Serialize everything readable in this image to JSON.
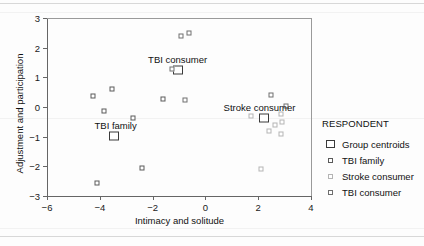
{
  "chart_data": {
    "type": "scatter",
    "title": "",
    "xlabel": "Intimacy and solitude",
    "ylabel": "Adjustment and participation",
    "xlim": [
      -6,
      4
    ],
    "ylim": [
      -3,
      3
    ],
    "xticks": [
      -6,
      -4,
      -2,
      0,
      2,
      4
    ],
    "yticks": [
      -3,
      -2,
      -1,
      0,
      1,
      2,
      3
    ],
    "xtick_labels": [
      "−6",
      "−4",
      "−2",
      "0",
      "2",
      "4"
    ],
    "ytick_labels": [
      "−3",
      "−2",
      "−1",
      "0",
      "1",
      "2",
      "3"
    ],
    "grid": false,
    "legend_position": "right",
    "legend_title": "RESPONDENT",
    "series": [
      {
        "name": "Group centroids",
        "marker": "open-square-large",
        "color": "#3a3a3a",
        "points": [
          {
            "x": -3.45,
            "y": -0.98
          },
          {
            "x": -1.02,
            "y": 1.25
          },
          {
            "x": 2.22,
            "y": -0.38
          }
        ]
      },
      {
        "name": "TBI family",
        "marker": "open-square-small",
        "color": "#5a5a5a",
        "points": [
          {
            "x": -4.25,
            "y": 0.38
          },
          {
            "x": -3.55,
            "y": 0.6
          },
          {
            "x": -3.85,
            "y": -0.13
          },
          {
            "x": -2.75,
            "y": -0.37
          },
          {
            "x": -2.42,
            "y": -2.05
          },
          {
            "x": -4.12,
            "y": -2.55
          },
          {
            "x": -1.62,
            "y": 0.28
          }
        ]
      },
      {
        "name": "Stroke consumer",
        "marker": "open-square-small",
        "color": "#b4b4b4",
        "points": [
          {
            "x": 1.72,
            "y": -0.3
          },
          {
            "x": 2.62,
            "y": -0.62
          },
          {
            "x": 2.4,
            "y": -0.82
          },
          {
            "x": 2.1,
            "y": -2.1
          },
          {
            "x": 2.88,
            "y": -0.22
          },
          {
            "x": 2.92,
            "y": -0.5
          },
          {
            "x": 2.85,
            "y": -0.92
          }
        ]
      },
      {
        "name": "TBI consumer",
        "marker": "open-square-small",
        "color": "#6f6f6f",
        "points": [
          {
            "x": -0.92,
            "y": 2.4
          },
          {
            "x": -0.62,
            "y": 2.5
          },
          {
            "x": -1.28,
            "y": 1.28
          },
          {
            "x": -0.78,
            "y": 0.22
          },
          {
            "x": 2.5,
            "y": 0.42
          },
          {
            "x": 3.05,
            "y": 0.02
          }
        ]
      }
    ],
    "annotations": [
      {
        "text": "TBI consumer",
        "x": -1.05,
        "y": 1.62
      },
      {
        "text": "TBI family",
        "x": -3.4,
        "y": -0.62
      },
      {
        "text": "Stroke consumer",
        "x": 2.05,
        "y": 0.0
      }
    ]
  },
  "legend": {
    "title": "RESPONDENT",
    "entries": [
      {
        "label": "Group centroids",
        "key": "group-centroids-key"
      },
      {
        "label": "TBI family",
        "key": "tbi-family-key"
      },
      {
        "label": "Stroke consumer",
        "key": "stroke-consumer-key"
      },
      {
        "label": "TBI consumer",
        "key": "tbi-consumer-key"
      }
    ]
  },
  "axes": {
    "x_title": "Intimacy and solitude",
    "y_title": "Adjustment and participation"
  }
}
